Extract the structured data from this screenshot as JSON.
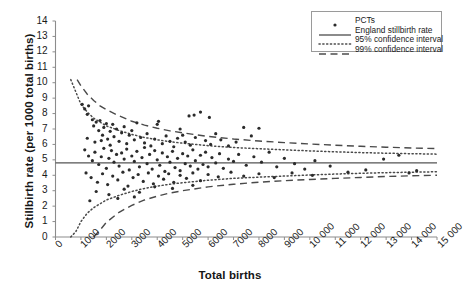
{
  "chart_data": {
    "type": "scatter",
    "subtype": "funnel-plot",
    "title": "",
    "xlabel": "Total births",
    "ylabel": "Stillbirth rate (per 1000 total births)",
    "xlim": [
      0,
      15000
    ],
    "ylim": [
      0,
      14
    ],
    "grid": false,
    "legend_position": "top-right",
    "x_ticks": [
      0,
      1000,
      2000,
      3000,
      4000,
      5000,
      6000,
      7000,
      8000,
      9000,
      10000,
      11000,
      12000,
      13000,
      14000,
      15000
    ],
    "x_tick_labels": [
      "0",
      "1000",
      "2000",
      "3000",
      "4000",
      "5000",
      "6000",
      "7000",
      "8000",
      "9000",
      "10 000",
      "11 000",
      "12 000",
      "13 000",
      "14 000",
      "15 000"
    ],
    "y_ticks": [
      0,
      1,
      2,
      3,
      4,
      5,
      6,
      7,
      8,
      9,
      10,
      11,
      12,
      13,
      14
    ],
    "y_tick_labels": [
      "0",
      "1",
      "2",
      "3",
      "4",
      "5",
      "6",
      "7",
      "8",
      "9",
      "10",
      "11",
      "12",
      "13",
      "14"
    ],
    "legend": [
      {
        "label": "PCTs",
        "key": "marker",
        "color": "#2b2b2b"
      },
      {
        "label": "England stillbirth rate",
        "key": "solid-line",
        "color": "#4d4d4d"
      },
      {
        "label": "95% confidence interval",
        "key": "dotted-line",
        "color": "#4d4d4d"
      },
      {
        "label": "99% confidence interval",
        "key": "dashed-line",
        "color": "#4d4d4d"
      }
    ],
    "series": [
      {
        "name": "England stillbirth rate",
        "type": "reference-line",
        "value": 4.8,
        "style": "solid",
        "color": "#555555"
      },
      {
        "name": "95% confidence interval",
        "type": "funnel-band",
        "style": "dotted",
        "color": "#4a4a4a",
        "upper": [
          [
            600,
            10.2
          ],
          [
            800,
            9.4
          ],
          [
            1000,
            8.6
          ],
          [
            1250,
            8.1
          ],
          [
            1500,
            7.7
          ],
          [
            1750,
            7.45
          ],
          [
            2000,
            7.2
          ],
          [
            2500,
            6.9
          ],
          [
            3000,
            6.65
          ],
          [
            3500,
            6.45
          ],
          [
            4000,
            6.3
          ],
          [
            4500,
            6.18
          ],
          [
            5000,
            6.08
          ],
          [
            6000,
            5.92
          ],
          [
            7000,
            5.8
          ],
          [
            8000,
            5.72
          ],
          [
            9000,
            5.65
          ],
          [
            10000,
            5.58
          ],
          [
            11000,
            5.52
          ],
          [
            12000,
            5.47
          ],
          [
            13000,
            5.43
          ],
          [
            14000,
            5.4
          ],
          [
            15000,
            5.37
          ]
        ],
        "lower": [
          [
            600,
            0.0
          ],
          [
            800,
            0.35
          ],
          [
            1000,
            1.0
          ],
          [
            1250,
            1.55
          ],
          [
            1500,
            1.9
          ],
          [
            1750,
            2.15
          ],
          [
            2000,
            2.4
          ],
          [
            2500,
            2.7
          ],
          [
            3000,
            2.95
          ],
          [
            3500,
            3.15
          ],
          [
            4000,
            3.3
          ],
          [
            4500,
            3.42
          ],
          [
            5000,
            3.52
          ],
          [
            6000,
            3.68
          ],
          [
            7000,
            3.8
          ],
          [
            8000,
            3.88
          ],
          [
            9000,
            3.95
          ],
          [
            10000,
            4.02
          ],
          [
            11000,
            4.08
          ],
          [
            12000,
            4.13
          ],
          [
            13000,
            4.17
          ],
          [
            14000,
            4.2
          ],
          [
            15000,
            4.23
          ]
        ]
      },
      {
        "name": "99% confidence interval",
        "type": "funnel-band",
        "style": "dashed",
        "color": "#4a4a4a",
        "upper": [
          [
            850,
            10.2
          ],
          [
            1000,
            9.8
          ],
          [
            1250,
            9.25
          ],
          [
            1500,
            8.85
          ],
          [
            1750,
            8.5
          ],
          [
            2000,
            8.25
          ],
          [
            2500,
            7.85
          ],
          [
            3000,
            7.5
          ],
          [
            3500,
            7.25
          ],
          [
            4000,
            7.05
          ],
          [
            4500,
            6.88
          ],
          [
            5000,
            6.75
          ],
          [
            6000,
            6.52
          ],
          [
            7000,
            6.35
          ],
          [
            8000,
            6.22
          ],
          [
            9000,
            6.12
          ],
          [
            10000,
            6.03
          ],
          [
            11000,
            5.95
          ],
          [
            12000,
            5.88
          ],
          [
            13000,
            5.82
          ],
          [
            14000,
            5.77
          ],
          [
            15000,
            5.73
          ]
        ],
        "lower": [
          [
            1500,
            0.0
          ],
          [
            1750,
            0.45
          ],
          [
            2000,
            0.95
          ],
          [
            2500,
            1.6
          ],
          [
            3000,
            2.05
          ],
          [
            3500,
            2.4
          ],
          [
            4000,
            2.65
          ],
          [
            4500,
            2.85
          ],
          [
            5000,
            3.0
          ],
          [
            6000,
            3.25
          ],
          [
            7000,
            3.42
          ],
          [
            8000,
            3.55
          ],
          [
            9000,
            3.65
          ],
          [
            10000,
            3.73
          ],
          [
            11000,
            3.8
          ],
          [
            12000,
            3.86
          ],
          [
            13000,
            3.92
          ],
          [
            14000,
            3.97
          ],
          [
            15000,
            4.0
          ]
        ]
      },
      {
        "name": "PCTs",
        "type": "scatter",
        "marker": "dot",
        "color": "#2b2b2b",
        "points": [
          [
            1050,
            8.6
          ],
          [
            1150,
            8.3
          ],
          [
            1250,
            7.95
          ],
          [
            1300,
            8.5
          ],
          [
            1450,
            7.6
          ],
          [
            1500,
            7.2
          ],
          [
            1600,
            7.45
          ],
          [
            1700,
            6.9
          ],
          [
            1750,
            7.55
          ],
          [
            1850,
            6.6
          ],
          [
            1900,
            7.1
          ],
          [
            2000,
            7.35
          ],
          [
            2050,
            6.35
          ],
          [
            2150,
            6.85
          ],
          [
            2250,
            7.3
          ],
          [
            2300,
            6.5
          ],
          [
            2400,
            7.0
          ],
          [
            2500,
            6.2
          ],
          [
            2600,
            6.75
          ],
          [
            2700,
            7.15
          ],
          [
            2800,
            6.05
          ],
          [
            2900,
            6.6
          ],
          [
            3000,
            6.9
          ],
          [
            3100,
            6.3
          ],
          [
            3200,
            7.4
          ],
          [
            3350,
            6.45
          ],
          [
            3500,
            6.1
          ],
          [
            3600,
            6.7
          ],
          [
            3750,
            5.9
          ],
          [
            3900,
            6.35
          ],
          [
            4000,
            7.3
          ],
          [
            4050,
            7.5
          ],
          [
            4200,
            6.05
          ],
          [
            4350,
            6.55
          ],
          [
            4500,
            6.2
          ],
          [
            4650,
            5.85
          ],
          [
            4800,
            6.4
          ],
          [
            4900,
            7.0
          ],
          [
            5000,
            6.6
          ],
          [
            5100,
            6.15
          ],
          [
            5300,
            5.95
          ],
          [
            5500,
            6.45
          ],
          [
            5700,
            8.1
          ],
          [
            5900,
            6.25
          ],
          [
            6100,
            6.0
          ],
          [
            6300,
            6.7
          ],
          [
            6500,
            6.3
          ],
          [
            6800,
            5.9
          ],
          [
            7100,
            6.15
          ],
          [
            7400,
            7.1
          ],
          [
            7700,
            6.55
          ],
          [
            8000,
            7.05
          ],
          [
            5250,
            7.85
          ],
          [
            5450,
            7.9
          ],
          [
            6050,
            7.75
          ],
          [
            1150,
            5.65
          ],
          [
            1300,
            5.25
          ],
          [
            1450,
            4.95
          ],
          [
            1550,
            5.5
          ],
          [
            1700,
            4.7
          ],
          [
            1800,
            5.2
          ],
          [
            1900,
            5.75
          ],
          [
            2000,
            4.45
          ],
          [
            2100,
            5.1
          ],
          [
            2200,
            5.6
          ],
          [
            2300,
            4.85
          ],
          [
            2400,
            5.35
          ],
          [
            2500,
            4.6
          ],
          [
            2600,
            5.45
          ],
          [
            2700,
            5.05
          ],
          [
            2800,
            5.7
          ],
          [
            2900,
            4.35
          ],
          [
            3000,
            5.25
          ],
          [
            3100,
            4.9
          ],
          [
            3200,
            5.55
          ],
          [
            3300,
            4.55
          ],
          [
            3400,
            5.15
          ],
          [
            3500,
            5.8
          ],
          [
            3600,
            4.75
          ],
          [
            3700,
            5.35
          ],
          [
            3800,
            4.4
          ],
          [
            3900,
            5.6
          ],
          [
            4000,
            5.0
          ],
          [
            4100,
            4.65
          ],
          [
            4200,
            5.45
          ],
          [
            4300,
            4.25
          ],
          [
            4400,
            5.2
          ],
          [
            4500,
            4.85
          ],
          [
            4600,
            5.55
          ],
          [
            4700,
            4.5
          ],
          [
            4800,
            5.1
          ],
          [
            4900,
            4.3
          ],
          [
            5000,
            5.4
          ],
          [
            5100,
            4.75
          ],
          [
            5200,
            5.25
          ],
          [
            5300,
            4.6
          ],
          [
            5400,
            5.65
          ],
          [
            5500,
            4.95
          ],
          [
            5600,
            4.4
          ],
          [
            5700,
            5.3
          ],
          [
            5800,
            4.7
          ],
          [
            5900,
            5.5
          ],
          [
            6000,
            4.55
          ],
          [
            6150,
            5.15
          ],
          [
            6300,
            4.8
          ],
          [
            6450,
            5.4
          ],
          [
            6600,
            4.45
          ],
          [
            6800,
            5.05
          ],
          [
            7000,
            4.9
          ],
          [
            7200,
            5.35
          ],
          [
            7500,
            4.65
          ],
          [
            7800,
            5.2
          ],
          [
            8100,
            4.85
          ],
          [
            8400,
            5.5
          ],
          [
            8700,
            4.55
          ],
          [
            9000,
            5.1
          ],
          [
            9400,
            4.75
          ],
          [
            9800,
            4.4
          ],
          [
            10200,
            4.95
          ],
          [
            10800,
            4.6
          ],
          [
            11500,
            4.2
          ],
          [
            12200,
            4.35
          ],
          [
            12900,
            5.05
          ],
          [
            13500,
            5.3
          ],
          [
            14200,
            4.3
          ],
          [
            1200,
            4.15
          ],
          [
            1400,
            3.85
          ],
          [
            1650,
            3.55
          ],
          [
            1850,
            4.1
          ],
          [
            2050,
            3.4
          ],
          [
            2250,
            3.95
          ],
          [
            2450,
            3.7
          ],
          [
            2650,
            4.2
          ],
          [
            2850,
            3.3
          ],
          [
            3050,
            3.85
          ],
          [
            3250,
            4.05
          ],
          [
            3450,
            3.6
          ],
          [
            3650,
            4.15
          ],
          [
            3850,
            3.45
          ],
          [
            4050,
            3.95
          ],
          [
            4250,
            3.75
          ],
          [
            4450,
            4.1
          ],
          [
            4650,
            3.55
          ],
          [
            4900,
            4.0
          ],
          [
            5150,
            3.8
          ],
          [
            5400,
            4.15
          ],
          [
            5700,
            3.65
          ],
          [
            6000,
            4.05
          ],
          [
            6400,
            3.9
          ],
          [
            6900,
            4.2
          ],
          [
            7400,
            3.95
          ],
          [
            8000,
            4.1
          ],
          [
            8600,
            3.85
          ],
          [
            9300,
            4.15
          ],
          [
            10100,
            4.0
          ],
          [
            1600,
            2.95
          ],
          [
            2100,
            2.75
          ],
          [
            2700,
            3.1
          ],
          [
            3300,
            2.9
          ],
          [
            3900,
            3.25
          ],
          [
            4600,
            3.15
          ],
          [
            5400,
            3.35
          ],
          [
            1350,
            2.35
          ],
          [
            2450,
            2.5
          ],
          [
            3100,
            2.6
          ],
          [
            1250,
            6.4
          ],
          [
            1550,
            6.15
          ],
          [
            1800,
            6.25
          ],
          [
            2150,
            5.95
          ],
          [
            13900,
            4.15
          ]
        ]
      }
    ]
  }
}
